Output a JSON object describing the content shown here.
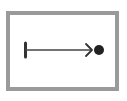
{
  "diagram": {
    "colors": {
      "background": "#ffffff",
      "frame": "#9a9a9a",
      "arrow": "#333333",
      "dot": "#222222"
    },
    "frame": {
      "x": 8,
      "y": 13,
      "width": 109,
      "height": 76,
      "stroke_width": 4
    },
    "arrow": {
      "start_bar": {
        "x": 25,
        "y1": 43,
        "y2": 57
      },
      "line": {
        "x1": 25,
        "y1": 50,
        "x2": 92,
        "y2": 50
      },
      "head": {
        "tip_x": 92,
        "tip_y": 50
      },
      "end_dot": {
        "cx": 99,
        "cy": 50,
        "r": 5
      }
    }
  }
}
